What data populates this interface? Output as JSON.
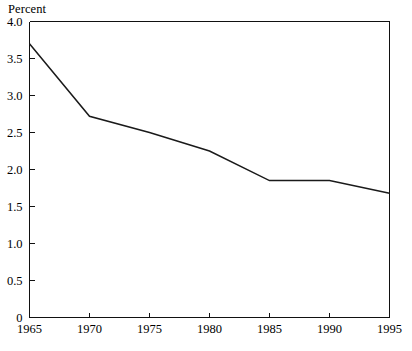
{
  "chart_data": {
    "type": "line",
    "title": "",
    "ylabel": "Percent",
    "xlabel": "",
    "x": [
      1965,
      1970,
      1975,
      1980,
      1985,
      1990,
      1995
    ],
    "values": [
      3.7,
      2.72,
      2.5,
      2.25,
      1.85,
      1.85,
      1.68
    ],
    "series": [
      {
        "name": "Percent",
        "values": [
          3.7,
          2.72,
          2.5,
          2.25,
          1.85,
          1.85,
          1.68
        ]
      }
    ],
    "xlim": [
      1965,
      1995
    ],
    "ylim": [
      0,
      4.0
    ],
    "xticks": [
      1965,
      1970,
      1975,
      1980,
      1985,
      1990,
      1995
    ],
    "xtick_labels": [
      "1965",
      "1970",
      "1975",
      "1980",
      "1985",
      "1990",
      "1995"
    ],
    "yticks": [
      0,
      0.5,
      1.0,
      1.5,
      2.0,
      2.5,
      3.0,
      3.5,
      4.0
    ],
    "ytick_labels": [
      "0",
      "0.5",
      "1.0",
      "1.5",
      "2.0",
      "2.5",
      "3.0",
      "3.5",
      "4.0"
    ],
    "grid": false,
    "legend": false,
    "legend_position": "none",
    "line_color": "#1a1a1a",
    "axis_color": "#111111",
    "background_color": "#ffffff"
  },
  "axis_title": {
    "text": "Percent"
  }
}
